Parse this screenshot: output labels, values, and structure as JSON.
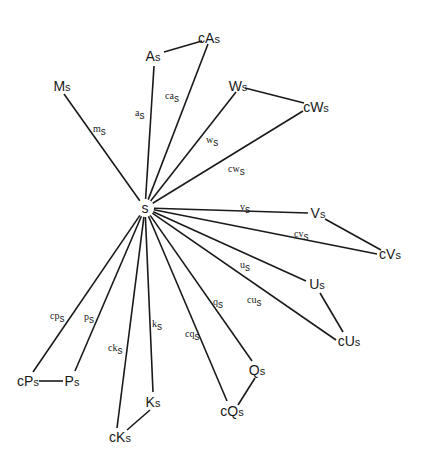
{
  "diagram": {
    "type": "star-graph",
    "center": {
      "id": "s",
      "label": "s",
      "x": 145,
      "y": 208
    },
    "nodes": [
      {
        "id": "Ms",
        "main": "M",
        "sub": "s",
        "x": 62,
        "y": 86
      },
      {
        "id": "As",
        "main": "A",
        "sub": "s",
        "x": 153,
        "y": 56
      },
      {
        "id": "cAs",
        "main": "cA",
        "sub": "s",
        "x": 209,
        "y": 38
      },
      {
        "id": "Ws",
        "main": "W",
        "sub": "s",
        "x": 238,
        "y": 86
      },
      {
        "id": "cWs",
        "main": "cW",
        "sub": "s",
        "x": 316,
        "y": 107
      },
      {
        "id": "Vs",
        "main": "V",
        "sub": "s",
        "x": 318,
        "y": 213
      },
      {
        "id": "cVs",
        "main": "cV",
        "sub": "s",
        "x": 390,
        "y": 254
      },
      {
        "id": "Us",
        "main": "U",
        "sub": "s",
        "x": 317,
        "y": 284
      },
      {
        "id": "cUs",
        "main": "cU",
        "sub": "s",
        "x": 349,
        "y": 341
      },
      {
        "id": "Qs",
        "main": "Q",
        "sub": "s",
        "x": 257,
        "y": 370
      },
      {
        "id": "cQs",
        "main": "cQ",
        "sub": "s",
        "x": 232,
        "y": 411
      },
      {
        "id": "Ks",
        "main": "K",
        "sub": "s",
        "x": 153,
        "y": 402
      },
      {
        "id": "cKs",
        "main": "cK",
        "sub": "s",
        "x": 120,
        "y": 437
      },
      {
        "id": "Ps",
        "main": "P",
        "sub": "s",
        "x": 72,
        "y": 381
      },
      {
        "id": "cPs",
        "main": "cP",
        "sub": "s",
        "x": 28,
        "y": 381
      }
    ],
    "spokes": [
      {
        "to": "Ms",
        "x2": 64,
        "y2": 94,
        "label": "m",
        "sub": "s",
        "lx": 93,
        "ly": 132
      },
      {
        "to": "As",
        "x2": 154,
        "y2": 66,
        "label": "a",
        "sub": "s",
        "lx": 135,
        "ly": 116
      },
      {
        "to": "cAs",
        "x2": 208,
        "y2": 44,
        "label": "ca",
        "sub": "s",
        "lx": 165,
        "ly": 99
      },
      {
        "to": "Ws",
        "x2": 236,
        "y2": 92,
        "label": "w",
        "sub": "s",
        "lx": 206,
        "ly": 143
      },
      {
        "to": "cWs",
        "x2": 303,
        "y2": 111,
        "label": "cw",
        "sub": "s",
        "lx": 228,
        "ly": 172
      },
      {
        "to": "Vs",
        "x2": 308,
        "y2": 213,
        "label": "v",
        "sub": "s",
        "lx": 240,
        "ly": 210
      },
      {
        "to": "cVs",
        "x2": 377,
        "y2": 254,
        "label": "cv",
        "sub": "s",
        "lx": 294,
        "ly": 237
      },
      {
        "to": "Us",
        "x2": 306,
        "y2": 281,
        "label": "u",
        "sub": "s",
        "lx": 240,
        "ly": 268
      },
      {
        "to": "cUs",
        "x2": 336,
        "y2": 340,
        "label": "cu",
        "sub": "s",
        "lx": 247,
        "ly": 303
      },
      {
        "to": "Qs",
        "x2": 252,
        "y2": 361,
        "label": "q",
        "sub": "s",
        "lx": 213,
        "ly": 305
      },
      {
        "to": "cQs",
        "x2": 227,
        "y2": 401,
        "label": "cq",
        "sub": "s",
        "lx": 185,
        "ly": 337
      },
      {
        "to": "Ks",
        "x2": 153,
        "y2": 392,
        "label": "k",
        "sub": "s",
        "lx": 152,
        "ly": 327
      },
      {
        "to": "cKs",
        "x2": 117,
        "y2": 428,
        "label": "ck",
        "sub": "s",
        "lx": 108,
        "ly": 351
      },
      {
        "to": "Ps",
        "x2": 75,
        "y2": 371,
        "label": "p",
        "sub": "s",
        "lx": 84,
        "ly": 320
      },
      {
        "to": "cPs",
        "x2": 33,
        "y2": 372,
        "label": "cp",
        "sub": "s",
        "lx": 50,
        "ly": 319
      }
    ],
    "pair_edges": [
      {
        "from": "As",
        "to": "cAs",
        "x1": 164,
        "y1": 52,
        "x2": 202,
        "y2": 41
      },
      {
        "from": "Ws",
        "to": "cWs",
        "x1": 245,
        "y1": 88,
        "x2": 304,
        "y2": 103
      },
      {
        "from": "Vs",
        "to": "cVs",
        "x1": 325,
        "y1": 219,
        "x2": 381,
        "y2": 250
      },
      {
        "from": "Us",
        "to": "cUs",
        "x1": 320,
        "y1": 293,
        "x2": 343,
        "y2": 332
      },
      {
        "from": "Qs",
        "to": "cQs",
        "x1": 255,
        "y1": 378,
        "x2": 238,
        "y2": 405
      },
      {
        "from": "Ks",
        "to": "cKs",
        "x1": 150,
        "y1": 410,
        "x2": 127,
        "y2": 430
      },
      {
        "from": "cPs",
        "to": "Ps",
        "x1": 39,
        "y1": 381,
        "x2": 63,
        "y2": 381
      }
    ],
    "colors": {
      "stroke": "#1a1a1a",
      "background": "#ffffff"
    }
  }
}
